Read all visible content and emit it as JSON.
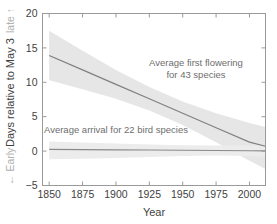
{
  "chart_data": {
    "type": "line",
    "title": "",
    "xlabel": "Year",
    "ylabel": "Days relative to May 3",
    "ylabel_low_marker": "← Early",
    "ylabel_high_marker": "late ↑",
    "xlim": [
      1845,
      2012
    ],
    "ylim": [
      -5,
      20
    ],
    "xticks": [
      1850,
      1875,
      1900,
      1925,
      1950,
      1975,
      2000
    ],
    "xticklabels": [
      "1850",
      "1875",
      "1900",
      "1925",
      "1950",
      "1975",
      "2000"
    ],
    "yticks": [
      -5,
      0,
      5,
      10,
      15,
      20
    ],
    "yticklabels": [
      "−5",
      "0",
      "5",
      "10",
      "15",
      "20"
    ],
    "grid": false,
    "legend_position": "inline-annotations",
    "series": [
      {
        "name": "Average first flowering for 43 species",
        "annotation_line1": "Average first flowering",
        "annotation_line2": "for 43 species",
        "color": "#808080",
        "band_color": "#e6e6e6",
        "x": [
          1850,
          1875,
          1900,
          1925,
          1950,
          1975,
          2000,
          2012
        ],
        "values": [
          13.9,
          11.8,
          9.7,
          7.6,
          5.5,
          3.4,
          1.3,
          0.7
        ],
        "band_upper": [
          17.5,
          14.6,
          11.8,
          9.3,
          7.2,
          5.5,
          4.1,
          3.5
        ],
        "band_lower": [
          10.3,
          9.0,
          7.6,
          5.9,
          3.8,
          1.3,
          -1.4,
          -2.6
        ]
      },
      {
        "name": "Average arrival for 22 bird species",
        "annotation_line1": "Average arrival for 22 bird species",
        "annotation_line2": "",
        "color": "#8a8a8a",
        "band_color": "#ececec",
        "x": [
          1850,
          1875,
          1900,
          1925,
          1950,
          1975,
          2000,
          2012
        ],
        "values": [
          0.25,
          0.22,
          0.19,
          0.16,
          0.12,
          0.09,
          0.05,
          0.03
        ],
        "band_upper": [
          1.4,
          1.25,
          1.1,
          0.95,
          0.85,
          0.8,
          0.8,
          0.8
        ],
        "band_lower": [
          -1.2,
          -1.1,
          -1.0,
          -0.85,
          -0.7,
          -0.65,
          -0.7,
          -0.8
        ]
      }
    ]
  },
  "colors": {
    "axis": "#9a9a9a",
    "text": "#3f3f3f",
    "faint_text": "#b0b0b0",
    "annotation_text": "#6e6e6e",
    "background": "#ffffff"
  }
}
